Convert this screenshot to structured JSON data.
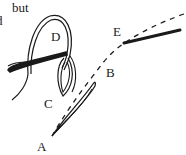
{
  "fragments": {
    "line1": "but",
    "line2": "d"
  },
  "labels": {
    "A": "A",
    "B": "B",
    "C": "C",
    "D": "D",
    "E": "E"
  },
  "colors": {
    "ink": "#1a1a1a",
    "background": "#ffffff"
  }
}
